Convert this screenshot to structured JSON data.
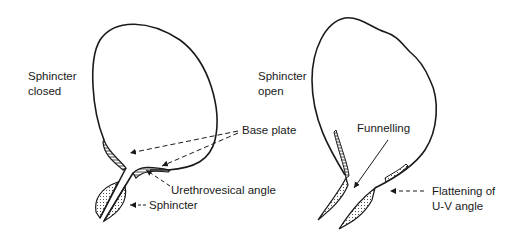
{
  "left_panel": {
    "title_line1": "Sphincter",
    "title_line2": "closed",
    "base_plate": "Base plate",
    "urethrovesical_angle": "Urethrovesical angle",
    "sphincter": "Sphincter"
  },
  "right_panel": {
    "title_line1": "Sphincter",
    "title_line2": "open",
    "funnelling": "Funnelling",
    "flattening_line1": "Flattening of",
    "flattening_line2": "U-V angle"
  },
  "colors": {
    "ink": "#1a1a1a",
    "background": "#ffffff"
  }
}
